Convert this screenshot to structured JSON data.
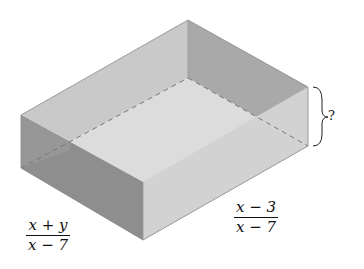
{
  "figure": {
    "length_label": {
      "numerator": "x + y",
      "denominator": "x − 7"
    },
    "width_label": {
      "numerator": "x − 3",
      "denominator": "x − 7"
    },
    "height_label": "?",
    "colors": {
      "outer_side": "#8f8f8f",
      "inner_wall": "#bdbdbd",
      "floor": "#d9d9d9",
      "outline": "#666666"
    }
  }
}
